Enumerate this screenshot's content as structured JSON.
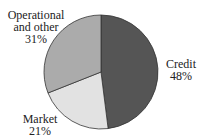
{
  "chart_data": {
    "type": "pie",
    "title": "",
    "categories": [
      "Credit",
      "Market",
      "Operational and other"
    ],
    "values": [
      48,
      21,
      31
    ],
    "unit": "%",
    "colors": [
      "#555555",
      "#e2e2e2",
      "#ababab"
    ],
    "start_angle": "12 o'clock",
    "direction": "clockwise",
    "legend": "none (direct labels)",
    "labels": [
      {
        "name_lines": [
          "Credit"
        ],
        "value": "48%"
      },
      {
        "name_lines": [
          "Market"
        ],
        "value": "21%"
      },
      {
        "name_lines": [
          "Operational",
          "and other"
        ],
        "value": "31%"
      }
    ]
  },
  "geometry": {
    "cx": 101,
    "cy": 72,
    "r": 57
  },
  "style": {
    "edge_color": "#333333",
    "background": "#ffffff"
  }
}
